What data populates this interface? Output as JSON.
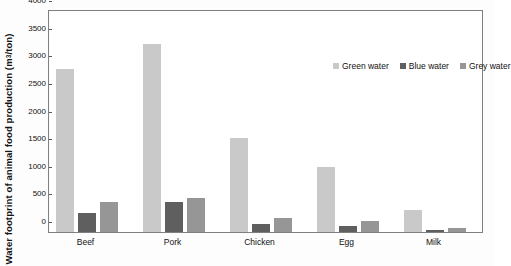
{
  "chart_data": {
    "type": "bar",
    "title": "",
    "xlabel": "",
    "ylabel": "Water footprint of animal food production (m3/ton)",
    "ylabel_prefix": "Water footprint of animal food production (m",
    "ylabel_exponent": "3",
    "ylabel_suffix": "/ton)",
    "ylim": [
      0,
      4000
    ],
    "yticks": [
      0,
      500,
      1000,
      1500,
      2000,
      2500,
      3000,
      3500,
      4000
    ],
    "ytick_labels": [
      "0",
      "500",
      "1000",
      "1500",
      "2000",
      "2500",
      "3000",
      "3500",
      "4000"
    ],
    "grid": false,
    "legend_position": "top-right-inside",
    "categories": [
      "Beef",
      "Pork",
      "Chicken",
      "Egg",
      "Milk"
    ],
    "series": [
      {
        "name": "Green water",
        "color": "#c9c9c9",
        "values": [
          2950,
          3400,
          1700,
          1180,
          400
        ]
      },
      {
        "name": "Blue water",
        "color": "#5f5f5f",
        "values": [
          350,
          540,
          150,
          100,
          30
        ]
      },
      {
        "name": "Grey water",
        "color": "#969696",
        "values": [
          550,
          610,
          260,
          200,
          70
        ]
      }
    ]
  },
  "legend": {
    "items": [
      {
        "label": "Green water",
        "color": "#c9c9c9"
      },
      {
        "label": "Blue water",
        "color": "#5f5f5f"
      },
      {
        "label": "Grey water",
        "color": "#969696"
      }
    ]
  }
}
